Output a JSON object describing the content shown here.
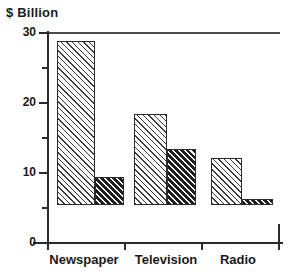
{
  "chart_data": {
    "type": "bar",
    "title": "",
    "xlabel": "",
    "ylabel": "$ Billion",
    "ylim": [
      0,
      30
    ],
    "yticks": [
      0,
      10,
      20,
      30
    ],
    "yticks_minor": [
      5,
      15,
      25
    ],
    "grid": false,
    "legend": "none",
    "categories": [
      "Newspaper",
      "Television",
      "Radio"
    ],
    "series": [
      {
        "name": "series-1",
        "pattern": "light-hatch",
        "values": [
          23.5,
          13.0,
          6.7
        ]
      },
      {
        "name": "series-2",
        "pattern": "dark-hatch",
        "values": [
          4.0,
          8.0,
          0.8
        ]
      }
    ]
  },
  "axis": {
    "y_title": "$ Billion",
    "y_tick_labels": [
      "30",
      "20",
      "10",
      "0"
    ],
    "x_tick_labels": [
      "Newspaper",
      "Television",
      "Radio"
    ]
  },
  "colors": {
    "axis": "#2b2b2b",
    "text": "#1a1a1a",
    "light_hatch": "#3a3a3a",
    "dark_hatch": "#1e1e1e",
    "background": "#ffffff"
  }
}
